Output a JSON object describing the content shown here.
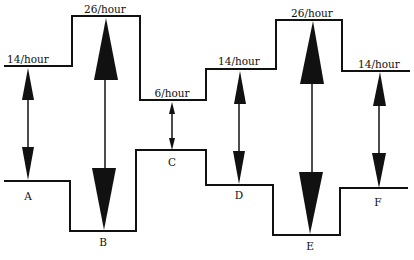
{
  "diagram": {
    "rate_labels": [
      {
        "id": "A",
        "text": "14/hour",
        "x": 28,
        "y": 54
      },
      {
        "id": "B",
        "text": "26/hour",
        "x": 105,
        "y": 5
      },
      {
        "id": "C",
        "text": "6/hour",
        "x": 172,
        "y": 88
      },
      {
        "id": "D",
        "text": "14/hour",
        "x": 239,
        "y": 56
      },
      {
        "id": "E",
        "text": "26/hour",
        "x": 312,
        "y": 8
      },
      {
        "id": "F",
        "text": "14/hour",
        "x": 379,
        "y": 59
      }
    ],
    "point_labels": [
      {
        "text": "A",
        "x": 28,
        "y": 192
      },
      {
        "text": "B",
        "x": 103,
        "y": 238
      },
      {
        "text": "C",
        "x": 172,
        "y": 157
      },
      {
        "text": "D",
        "x": 239,
        "y": 190
      },
      {
        "text": "E",
        "x": 310,
        "y": 241
      },
      {
        "text": "F",
        "x": 378,
        "y": 197
      }
    ],
    "colors": {
      "line": "#111111",
      "background": "#ffffff"
    }
  }
}
